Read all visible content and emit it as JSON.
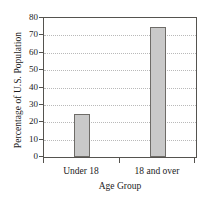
{
  "chart_data": {
    "type": "bar",
    "title": "",
    "categories": [
      "Under 18",
      "18 and over"
    ],
    "values": [
      25,
      75
    ],
    "series": [
      {
        "name": "Percentage of U.S. Population",
        "values": [
          25,
          75
        ]
      }
    ],
    "xlabel": "Age Group",
    "ylabel": "Percentage of U.S. Population",
    "ylim": [
      0,
      80
    ],
    "yticks": [
      0,
      10,
      20,
      30,
      40,
      50,
      60,
      70,
      80
    ],
    "ytick_labels": [
      "0",
      "10",
      "20",
      "30",
      "40",
      "50",
      "60",
      "70",
      "80"
    ],
    "xtick_labels": [
      "Under 18",
      "18 and over"
    ],
    "grid": true,
    "grid_axis": "y",
    "grid_style": "dotted",
    "legend": false,
    "legend_position": "none",
    "bar_fill_color": "#c9c9c9",
    "bar_border_color": "#6e6c68",
    "axis_color": "#55534f",
    "grid_color": "#b9b9b9",
    "text_color": "#1c1c1c",
    "background_color": "#ffffff"
  }
}
